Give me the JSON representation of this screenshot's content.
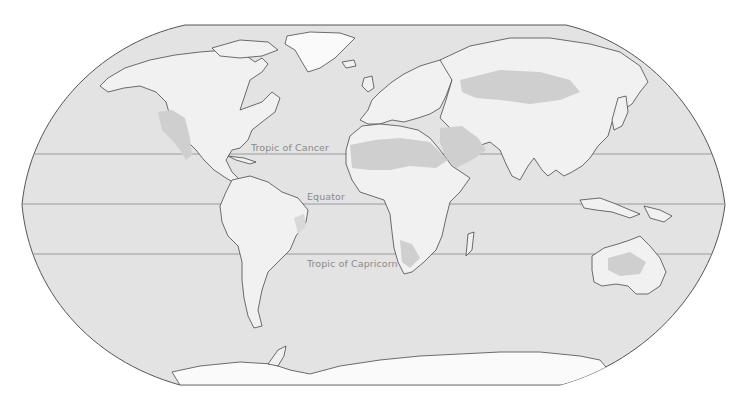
{
  "map": {
    "projection": "world-robinson-style",
    "colors": {
      "background": "#ffffff",
      "ocean": "#e3e3e3",
      "land": "#f1f1f1",
      "desert": "#cfcfcf",
      "coastline": "#4a4a4a",
      "latitude_line": "#9a9a9a",
      "label": "#8a8a8a"
    },
    "latitude_lines": [
      {
        "name": "tropic-of-cancer",
        "label": "Tropic of Cancer",
        "y": 154
      },
      {
        "name": "equator",
        "label": "Equator",
        "y": 204
      },
      {
        "name": "tropic-of-capricorn",
        "label": "Tropic of Capricorn",
        "y": 254
      }
    ]
  }
}
